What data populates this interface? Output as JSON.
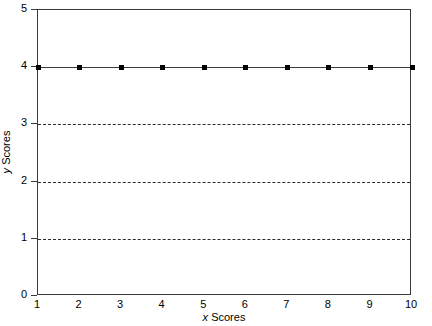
{
  "chart_data": {
    "type": "line",
    "title": "",
    "subtitle": "",
    "xlabel_prefix": "x",
    "xlabel_suffix": " Scores",
    "ylabel_prefix": "y",
    "ylabel_suffix": " Scores",
    "xlim": [
      1,
      10
    ],
    "ylim": [
      0,
      5
    ],
    "x_tick_labels": [
      "1",
      "2",
      "3",
      "4",
      "5",
      "6",
      "7",
      "8",
      "9",
      "10"
    ],
    "x_ticks": [
      1,
      2,
      3,
      4,
      5,
      6,
      7,
      8,
      9,
      10
    ],
    "y_tick_labels": [
      "0",
      "1",
      "2",
      "3",
      "4",
      "5"
    ],
    "y_ticks": [
      0,
      1,
      2,
      3,
      4,
      5
    ],
    "grid": "horizontal-dashed",
    "gridlines_y": [
      1,
      2,
      3
    ],
    "legend": "none",
    "marker": "filled-square",
    "line_style": "solid",
    "series_color": "#000000",
    "grid_color": "#2c2c2c",
    "axis_color": "#3a3a3a",
    "background": "#ffffff",
    "x": [
      1,
      2,
      3,
      4,
      5,
      6,
      7,
      8,
      9,
      10
    ],
    "values": [
      4,
      4,
      4,
      4,
      4,
      4,
      4,
      4,
      4,
      4
    ],
    "series": [
      {
        "name": "y Scores",
        "values": [
          4,
          4,
          4,
          4,
          4,
          4,
          4,
          4,
          4,
          4
        ]
      }
    ]
  }
}
